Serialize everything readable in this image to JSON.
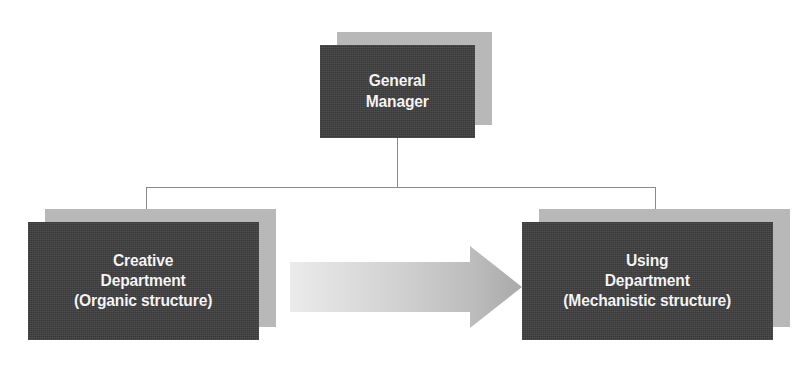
{
  "diagram": {
    "type": "organizational-chart",
    "background_color": "#ffffff",
    "node_fill_color": "#3f3f3f",
    "node_shadow_color": "#b8b8b8",
    "node_text_color": "#ffffff",
    "connector_color": "#8a8a8a",
    "arrow_color_start": "#e8e8e8",
    "arrow_color_end": "#a9a9a9",
    "nodes": [
      {
        "id": "general-manager",
        "level": "top",
        "line1": "General",
        "line2": "Manager",
        "line3": "",
        "font_size": 17
      },
      {
        "id": "creative-department",
        "level": "child-left",
        "line1": "Creative",
        "line2": "Department",
        "line3": "(Organic structure)",
        "font_size": 17
      },
      {
        "id": "using-department",
        "level": "child-right",
        "line1": "Using",
        "line2": "Department",
        "line3": "(Mechanistic structure)",
        "font_size": 17
      }
    ],
    "flow_arrow": {
      "from": "creative-department",
      "to": "using-department",
      "direction": "right",
      "label": ""
    }
  }
}
